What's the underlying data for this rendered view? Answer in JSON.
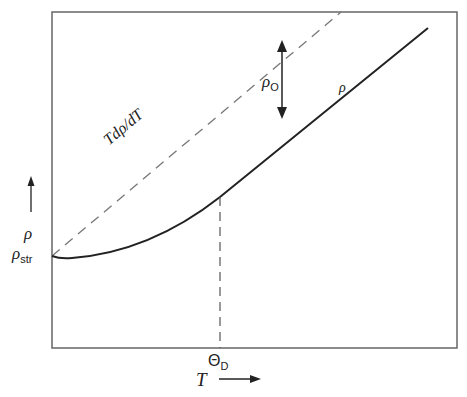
{
  "figure": {
    "type": "schematic-plot",
    "x_axis": {
      "label": "T",
      "arrow": "right-arrow"
    },
    "y_axis": {
      "label": "ρ",
      "arrow": "up-arrow"
    },
    "y_tick_label": {
      "main": "ρ",
      "sub": "str"
    },
    "x_tick_label": {
      "main": "Θ",
      "sub": "D"
    },
    "curves": [
      {
        "name": "resistivity",
        "label": "ρ",
        "style": "solid"
      },
      {
        "name": "asymptote",
        "label": "Tdρ/dT",
        "style": "dashed"
      }
    ],
    "gap_arrow": {
      "label_main": "ρ",
      "label_sub": "O"
    }
  },
  "colors": {
    "line": "#222222",
    "dash": "#777777",
    "frame": "#666666",
    "background": "#ffffff"
  }
}
